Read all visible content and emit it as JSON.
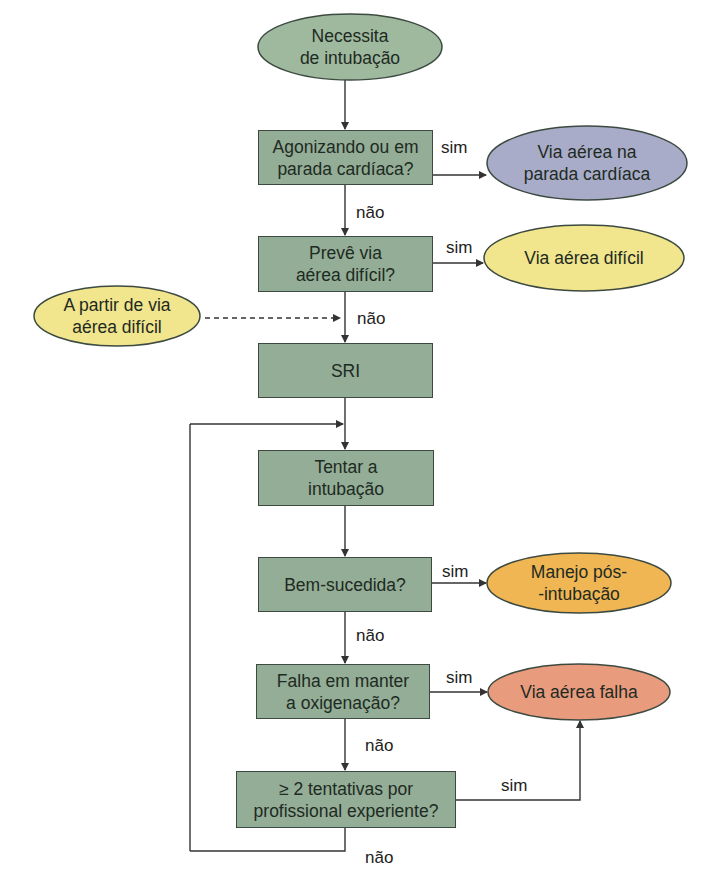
{
  "colors": {
    "process_box": "#93ad96",
    "start_oval": "#9fb99f",
    "cardiac_oval": "#a8acc9",
    "difficult_oval": "#f1e58d",
    "post_intubation_oval": "#f0b654",
    "failed_oval": "#e99b7e",
    "line": "#333333"
  },
  "nodes": {
    "start": "Necessita\nde intubação",
    "q_agonal": "Agonizando ou em\nparada cardíaca?",
    "r_cardiac": "Via aérea na\nparada cardíaca",
    "q_difficult": "Prevê via\naérea difícil?",
    "r_difficult": "Via aérea difícil",
    "from_difficult": "A partir de via\naérea difícil",
    "sri": "SRI",
    "attempt": "Tentar a\nintubação",
    "q_success": "Bem-sucedida?",
    "r_post": "Manejo pós-\n-intubação",
    "q_oxygen": "Falha em manter\na oxigenação?",
    "r_failed": "Via aérea falha",
    "q_attempts": "≥ 2 tentativas por\nprofissional experiente?"
  },
  "edge_labels": {
    "yes": "sim",
    "no": "não"
  }
}
